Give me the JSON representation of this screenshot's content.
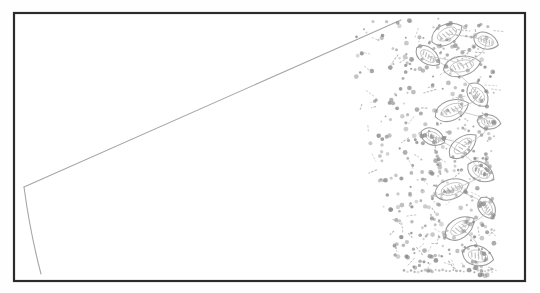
{
  "document": {
    "kind": "scanned-line-drawing",
    "subject": "pottery-sherd-profile-with-stamped-decoration",
    "title": "",
    "caption": "",
    "background_color": "#fefefe",
    "paper_color": "#ffffff"
  },
  "frame": {
    "name": "plate-border",
    "x": 14,
    "y": 13,
    "width": 511,
    "height": 268,
    "stroke_color": "#2b2b2b",
    "stroke_width": 2.2,
    "fill_color": "#ffffff"
  },
  "ink": {
    "outline_color": "#9a9a9a",
    "stipple_color": "#8e8e8e",
    "profile_color": "#a6a6a6",
    "light_color": "#bdbdbd"
  },
  "profile": {
    "name": "vessel-profile-line",
    "description": "long diagonal rim line running from upper right to lower left vertex, then a near-vertical wall line descending",
    "diagonal": {
      "start_x": 401,
      "start_y": 20,
      "end_x": 24,
      "end_y": 187,
      "stroke_width": 1.1
    },
    "wall": {
      "start_x": 24,
      "start_y": 187,
      "control_x": 30,
      "control_y": 232,
      "end_x": 41,
      "end_y": 274,
      "stroke_width": 1.1
    }
  },
  "decoration": {
    "name": "stamped-punctate-zone",
    "type": "leaf-petal-rosette-with-stipple",
    "left_boundary_top_x": 342,
    "left_boundary_bottom_x": 398,
    "right_boundary_x": 496,
    "top_y": 18,
    "bottom_y": 276,
    "motif_count": 14,
    "stipple_dot_count": 430,
    "leaves": [
      {
        "cx": 447,
        "cy": 34,
        "rx": 17,
        "ry": 11,
        "rot": -28
      },
      {
        "cx": 486,
        "cy": 41,
        "rx": 13,
        "ry": 9,
        "rot": 18
      },
      {
        "cx": 462,
        "cy": 66,
        "rx": 19,
        "ry": 11,
        "rot": -12
      },
      {
        "cx": 428,
        "cy": 56,
        "rx": 14,
        "ry": 9,
        "rot": 36
      },
      {
        "cx": 478,
        "cy": 95,
        "rx": 14,
        "ry": 10,
        "rot": 52
      },
      {
        "cx": 452,
        "cy": 110,
        "rx": 18,
        "ry": 11,
        "rot": -22
      },
      {
        "cx": 489,
        "cy": 122,
        "rx": 12,
        "ry": 8,
        "rot": 8
      },
      {
        "cx": 463,
        "cy": 146,
        "rx": 17,
        "ry": 10,
        "rot": -40
      },
      {
        "cx": 433,
        "cy": 137,
        "rx": 13,
        "ry": 9,
        "rot": 25
      },
      {
        "cx": 481,
        "cy": 172,
        "rx": 15,
        "ry": 10,
        "rot": 30
      },
      {
        "cx": 452,
        "cy": 189,
        "rx": 18,
        "ry": 11,
        "rot": -18
      },
      {
        "cx": 487,
        "cy": 208,
        "rx": 12,
        "ry": 9,
        "rot": 60
      },
      {
        "cx": 460,
        "cy": 228,
        "rx": 17,
        "ry": 11,
        "rot": -34
      },
      {
        "cx": 478,
        "cy": 256,
        "rx": 16,
        "ry": 11,
        "rot": 14
      }
    ],
    "baseline": {
      "name": "lower-dotted-baseline",
      "start_x": 404,
      "end_x": 492,
      "y": 271,
      "dot_count": 26
    }
  }
}
